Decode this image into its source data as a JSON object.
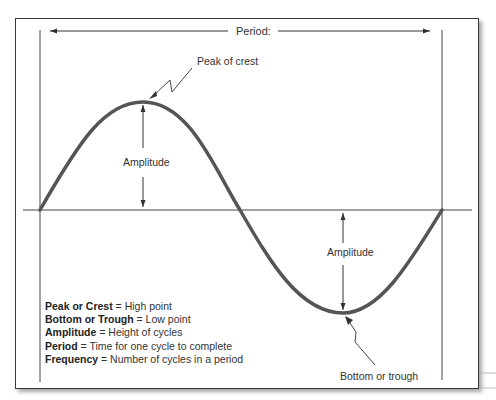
{
  "diagram": {
    "period_label": "Period:",
    "peak_label": "Peak of crest",
    "trough_label": "Bottom or trough",
    "amplitude_labels": [
      "Amplitude",
      "Amplitude"
    ],
    "curve_color": "#555555",
    "line_color": "#444444"
  },
  "legend": [
    {
      "term": "Peak or Crest",
      "definition": " = High point"
    },
    {
      "term": "Bottom or Trough",
      "definition": " = Low point"
    },
    {
      "term": "Amplitude",
      "definition": " = Height of cycles"
    },
    {
      "term": "Period",
      "definition": " = Time for one cycle to complete"
    },
    {
      "term": "Frequency",
      "definition": " = Number of cycles in a period"
    }
  ]
}
